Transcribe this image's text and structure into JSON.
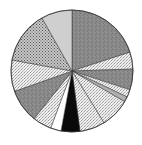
{
  "chart_data": {
    "type": "pie",
    "title": "",
    "legend": "none",
    "labels": [
      "Slice 1",
      "Slice 2",
      "Slice 3",
      "Slice 4",
      "Slice 5",
      "Slice 6",
      "Slice 7",
      "Slice 8",
      "Slice 9",
      "Slice 10",
      "Slice 11",
      "Slice 12",
      "Slice 13",
      "Slice 14"
    ],
    "values": [
      20.0,
      4.5,
      5.5,
      2.0,
      1.4,
      7.8,
      6.7,
      5.0,
      2.8,
      5.0,
      8.9,
      8.3,
      13.9,
      8.2
    ],
    "fills": [
      "#8a8a8a",
      "#e4e4e4",
      "#8e8e8e",
      "#e8e8e8",
      "#b0b0b0",
      "#d4d4d4",
      "#bdbdbd",
      "#0a0a0a",
      "#ffffff",
      "#c8c8c8",
      "#6e6e6e",
      "#dcdcdc",
      "#9a9a9a",
      "#cfcfcf"
    ],
    "patterns": [
      "noise",
      "speckle",
      "noise",
      "speckle",
      "solid",
      "speckle",
      "speckle",
      "solid",
      "solid",
      "speckle",
      "noise",
      "speckle",
      "crosshatch",
      "solid"
    ],
    "start_angle_deg": 0,
    "direction": "clockwise",
    "center": [
      72,
      71
    ],
    "radius": 61
  }
}
